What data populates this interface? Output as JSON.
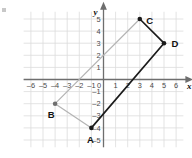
{
  "figure": {
    "background": "#ffffff",
    "grid": {
      "color": "#dcdcdc",
      "visible": true,
      "spacing_units": 1,
      "x_min": -6.6,
      "x_max": 6.6,
      "y_min": -5.6,
      "y_max": 5.6
    },
    "axes": {
      "color": "#6e6e6e",
      "x_label": "x",
      "y_label": "y",
      "x_ticks": [
        -6,
        -5,
        -4,
        -3,
        -2,
        -1,
        0,
        1,
        2,
        3,
        4,
        5,
        6
      ],
      "x_tick_labels": [
        "–6",
        "–5",
        "–4",
        "–3",
        "–2",
        "–1",
        "0",
        "1",
        "2",
        "3",
        "4",
        "5",
        "6"
      ],
      "y_ticks": [
        5,
        4,
        3,
        2,
        1,
        -1,
        -2,
        -3,
        -4,
        -5
      ],
      "y_tick_labels": [
        "5",
        "4",
        "3",
        "2",
        "1",
        "–1",
        "–2",
        "–3",
        "–4",
        "–5"
      ],
      "tick_label_color": "#4a4a4a"
    },
    "colors": {
      "dark_segment": "#1b1b1b",
      "light_segment": "#b4b4b4",
      "point_fill": "#1b1b1b",
      "light_point_fill": "#6e6e6e",
      "label_text": "#111111"
    },
    "points": [
      {
        "id": "A",
        "label": "A",
        "x": -1,
        "y": -4,
        "label_dx": -1,
        "label_dy": 15,
        "marker": "dark"
      },
      {
        "id": "B",
        "label": "B",
        "x": -4,
        "y": -2,
        "label_dx": -4,
        "label_dy": 14,
        "marker": "light"
      },
      {
        "id": "C",
        "label": "C",
        "x": 3,
        "y": 5,
        "label_dx": 10,
        "label_dy": 5,
        "marker": "dark"
      },
      {
        "id": "D",
        "label": "D",
        "x": 5,
        "y": 3,
        "label_dx": 11,
        "label_dy": 4,
        "marker": "dark"
      }
    ],
    "segments": [
      {
        "id": "AB",
        "from": "A",
        "to": "B",
        "style": "light"
      },
      {
        "id": "BC",
        "from": "B",
        "to": "C",
        "style": "light"
      },
      {
        "id": "CD",
        "from": "C",
        "to": "D",
        "style": "dark"
      },
      {
        "id": "DA",
        "from": "D",
        "to": "A",
        "style": "dark"
      }
    ]
  }
}
